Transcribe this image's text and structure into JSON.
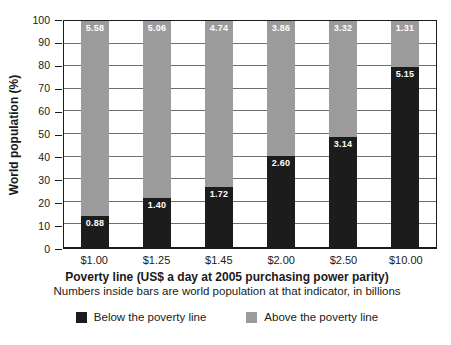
{
  "chart_data": {
    "type": "bar",
    "stacked": true,
    "categories": [
      "$1.00",
      "$1.25",
      "$1.45",
      "$2.00",
      "$2.50",
      "$10.00"
    ],
    "series": [
      {
        "name": "Below the poverty line",
        "color": "#1c1c1c",
        "values_billions": [
          0.88,
          1.4,
          1.72,
          2.6,
          3.14,
          5.15
        ],
        "labels": [
          "0.88",
          "1.40",
          "1.72",
          "2.60",
          "3.14",
          "5.15"
        ]
      },
      {
        "name": "Above the poverty line",
        "color": "#9b9b9b",
        "values_billions": [
          5.58,
          5.06,
          4.74,
          3.86,
          3.32,
          1.31
        ],
        "labels": [
          "5.58",
          "5.06",
          "4.74",
          "3.86",
          "3.32",
          "1.31"
        ]
      }
    ],
    "total_billions": 6.46,
    "xlabel": "Poverty line (US$ a day at 2005 purchasing power parity)",
    "x_subtitle": "Numbers inside bars are world population at that indicator, in billions",
    "ylabel": "World population (%)",
    "ylim": [
      0,
      100
    ],
    "ytick_step": 10,
    "grid": "horizontal",
    "legend_position": "bottom"
  },
  "colors": {
    "frame": "#1a1a1a",
    "gridline": "#6e6e6e",
    "background": "#ffffff",
    "bar_label_text": "#ffffff"
  }
}
